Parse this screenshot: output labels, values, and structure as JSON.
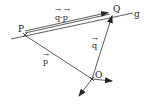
{
  "diagram": {
    "title": "",
    "points": {
      "P": {
        "label": "P",
        "x": 25,
        "y": 35
      },
      "Q": {
        "label": "Q",
        "x": 112,
        "y": 15
      },
      "O": {
        "label": "O",
        "x": 92,
        "y": 79
      }
    },
    "line": {
      "label": "g"
    },
    "vectors": {
      "p": {
        "label": "p",
        "from": "O",
        "to": "P"
      },
      "q": {
        "label": "q",
        "from": "O",
        "to": "Q"
      },
      "q_minus_p": {
        "label": "q-p",
        "from": "P",
        "to": "Q"
      }
    },
    "arrow_symbol": "→",
    "colors": {
      "ink": "#222222",
      "background": "#ffffff"
    }
  }
}
